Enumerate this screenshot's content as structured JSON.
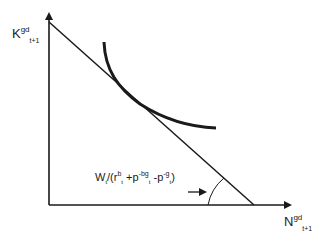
{
  "diagram": {
    "y_axis_label": {
      "base": "K",
      "superscript": "gd",
      "subscript": "t+1"
    },
    "x_axis_label": {
      "base": "N",
      "superscript": "gd",
      "subscript": "t+1"
    },
    "budget_line_label": {
      "prefix": "W",
      "prefix_sub": "t",
      "part1": "/(r",
      "part1_sup": "b",
      "part1_sub": "t",
      "part2": " +p",
      "part2_sup": "-bg",
      "part2_sub": "t",
      "part3": " -p",
      "part3_sup": "-g",
      "part3_sub": "t",
      "suffix": ")"
    },
    "elements": [
      "y-axis",
      "x-axis",
      "budget-line",
      "indifference-curve",
      "angle-arc",
      "label-arrow"
    ],
    "colors": {
      "stroke": "#1a1a1a",
      "background": "#ffffff"
    }
  }
}
